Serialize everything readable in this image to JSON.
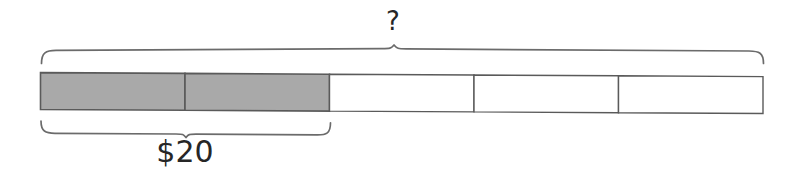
{
  "diagram": {
    "type": "tape-diagram",
    "title": "",
    "total_label": "?",
    "part_label": "$20",
    "total_cells": 5,
    "shaded_cells": 2,
    "unshaded_cells": 3,
    "shaded_value": 20,
    "unknown_value": "?",
    "cell_value": 10,
    "implied_total": 50,
    "colors": {
      "shaded_fill": "#a9a9a9",
      "unshaded_fill": "#ffffff",
      "stroke": "#5a5a5a",
      "brace": "#6b6b6b",
      "text": "#262626",
      "background": "#ffffff"
    },
    "cells": [
      {
        "index": 1,
        "shaded": true,
        "label": ""
      },
      {
        "index": 2,
        "shaded": true,
        "label": ""
      },
      {
        "index": 3,
        "shaded": false,
        "label": ""
      },
      {
        "index": 4,
        "shaded": false,
        "label": ""
      },
      {
        "index": 5,
        "shaded": false,
        "label": ""
      }
    ],
    "braces": [
      {
        "name": "top-brace",
        "position": "above",
        "spans_cells": "1-5",
        "label": "?"
      },
      {
        "name": "bottom-brace",
        "position": "below",
        "spans_cells": "1-2",
        "label": "$20"
      }
    ]
  }
}
